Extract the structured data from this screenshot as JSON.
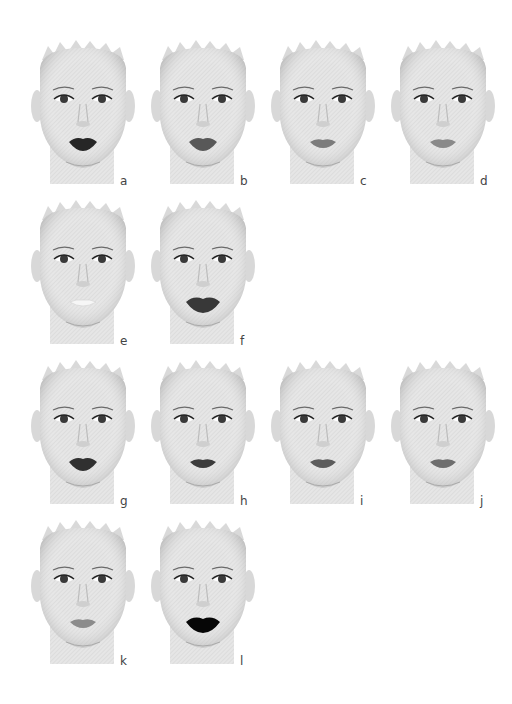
{
  "figure": {
    "background": "#ffffff",
    "skin_color": "#e4e4e4",
    "faces": [
      {
        "label": "a",
        "lip_color": "#262626",
        "lip_shape": "full"
      },
      {
        "label": "b",
        "lip_color": "#585858",
        "lip_shape": "full"
      },
      {
        "label": "c",
        "lip_color": "#7c7c7c",
        "lip_shape": "medium"
      },
      {
        "label": "d",
        "lip_color": "#8a8a8a",
        "lip_shape": "medium"
      },
      {
        "label": "e",
        "lip_color": "#f6f6f6",
        "lip_shape": "thin"
      },
      {
        "label": "f",
        "lip_color": "#383838",
        "lip_shape": "wide"
      },
      {
        "label": "g",
        "lip_color": "#303030",
        "lip_shape": "full"
      },
      {
        "label": "h",
        "lip_color": "#3c3c3c",
        "lip_shape": "medium"
      },
      {
        "label": "i",
        "lip_color": "#5c5c5c",
        "lip_shape": "medium"
      },
      {
        "label": "j",
        "lip_color": "#6e6e6e",
        "lip_shape": "medium"
      },
      {
        "label": "k",
        "lip_color": "#8c8c8c",
        "lip_shape": "medium"
      },
      {
        "label": "l",
        "lip_color": "#060606",
        "lip_shape": "wide"
      }
    ]
  }
}
